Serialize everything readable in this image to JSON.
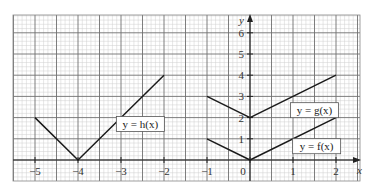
{
  "chart_data": {
    "type": "line",
    "title": "",
    "xlabel": "x",
    "ylabel": "y",
    "xlim": [
      -5.5,
      2.5
    ],
    "ylim": [
      -0.5,
      6.8
    ],
    "grid": true,
    "x_ticks": [
      -5,
      -4,
      -3,
      -2,
      -1,
      0,
      1,
      2
    ],
    "x_tick_labels": [
      "−5",
      "−4",
      "−3",
      "−2",
      "−1",
      "0",
      "1",
      "2"
    ],
    "y_ticks": [
      1,
      2,
      3,
      4,
      5,
      6
    ],
    "y_tick_labels": [
      "1",
      "2",
      "3",
      "4",
      "5",
      "6"
    ],
    "series": [
      {
        "name": "y = h(x)",
        "x": [
          -5,
          -4,
          -2
        ],
        "y": [
          2,
          0,
          4
        ],
        "label_pos": [
          -2.55,
          1.7
        ]
      },
      {
        "name": "y = g(x)",
        "x": [
          -1,
          0,
          2
        ],
        "y": [
          3,
          2,
          4
        ],
        "label_pos": [
          1.5,
          2.35
        ]
      },
      {
        "name": "y = f(x)",
        "x": [
          -1,
          0,
          2
        ],
        "y": [
          1,
          0,
          2
        ],
        "label_pos": [
          1.55,
          0.65
        ]
      }
    ],
    "annotations": [
      "y = h(x)",
      "y = g(x)",
      "y = f(x)"
    ],
    "legend_position": "inline labels"
  }
}
